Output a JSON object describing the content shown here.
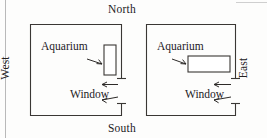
{
  "figure": {
    "background_color": "#fdfdfc",
    "ink_color": "#3a3734",
    "width": 267,
    "height": 138
  },
  "compass": {
    "north": "North",
    "south": "South",
    "west": "West",
    "east": "East"
  },
  "rooms": [
    {
      "id": "left-room",
      "position": "left",
      "aquarium_label": "Aquarium",
      "aquarium_orientation": "vertical",
      "window_label": "Window",
      "window_wall": "east",
      "arrow_count": 2
    },
    {
      "id": "right-room",
      "position": "right",
      "aquarium_label": "Aquarium",
      "aquarium_orientation": "horizontal",
      "window_label": "Window",
      "window_wall": "east",
      "arrow_count": 2
    }
  ],
  "icons": {
    "arrow": "arrow-left-icon",
    "room": "room-outline-icon",
    "tank": "aquarium-rect-icon"
  }
}
